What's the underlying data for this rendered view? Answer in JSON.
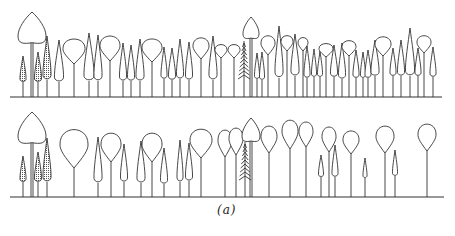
{
  "caption": "(a)",
  "colors": {
    "ink": "#333333",
    "background": "#ffffff"
  },
  "rows": [
    {
      "name": "top-row",
      "ground_y": 97,
      "ground_x": [
        10,
        442
      ],
      "trees": [
        {
          "type": "spade",
          "x": 32,
          "top": 12,
          "w": 28,
          "h": 32
        },
        {
          "type": "shaded",
          "x": 23,
          "top": 56,
          "w": 6,
          "h": 26
        },
        {
          "type": "shaded",
          "x": 38,
          "top": 52,
          "w": 7,
          "h": 30
        },
        {
          "type": "shaded",
          "x": 47,
          "top": 36,
          "w": 8,
          "h": 44
        },
        {
          "type": "narrow",
          "x": 59,
          "top": 40,
          "w": 9,
          "h": 42
        },
        {
          "type": "round",
          "x": 74,
          "top": 38,
          "w": 22,
          "h": 26
        },
        {
          "type": "narrow",
          "x": 89,
          "top": 33,
          "w": 10,
          "h": 48
        },
        {
          "type": "narrow",
          "x": 98,
          "top": 35,
          "w": 8,
          "h": 46
        },
        {
          "type": "round",
          "x": 110,
          "top": 35,
          "w": 20,
          "h": 26
        },
        {
          "type": "narrow",
          "x": 123,
          "top": 43,
          "w": 7,
          "h": 38
        },
        {
          "type": "narrow",
          "x": 131,
          "top": 45,
          "w": 7,
          "h": 36
        },
        {
          "type": "narrow",
          "x": 140,
          "top": 39,
          "w": 8,
          "h": 42
        },
        {
          "type": "round",
          "x": 152,
          "top": 38,
          "w": 20,
          "h": 24
        },
        {
          "type": "narrow",
          "x": 164,
          "top": 47,
          "w": 6,
          "h": 32
        },
        {
          "type": "narrow",
          "x": 172,
          "top": 48,
          "w": 7,
          "h": 32
        },
        {
          "type": "narrow",
          "x": 180,
          "top": 39,
          "w": 7,
          "h": 40
        },
        {
          "type": "narrow",
          "x": 189,
          "top": 42,
          "w": 7,
          "h": 38
        },
        {
          "type": "round",
          "x": 201,
          "top": 37,
          "w": 16,
          "h": 22
        },
        {
          "type": "narrow",
          "x": 213,
          "top": 36,
          "w": 8,
          "h": 44
        },
        {
          "type": "round",
          "x": 221,
          "top": 44,
          "w": 12,
          "h": 14
        },
        {
          "type": "round",
          "x": 234,
          "top": 44,
          "w": 12,
          "h": 14
        },
        {
          "type": "conifer",
          "x": 244,
          "top": 43,
          "w": 10,
          "h": 38
        },
        {
          "type": "spade",
          "x": 251,
          "top": 17,
          "w": 16,
          "h": 22
        },
        {
          "type": "narrow",
          "x": 257,
          "top": 53,
          "w": 5,
          "h": 26
        },
        {
          "type": "narrow",
          "x": 262,
          "top": 52,
          "w": 5,
          "h": 28
        },
        {
          "type": "round",
          "x": 268,
          "top": 35,
          "w": 14,
          "h": 20
        },
        {
          "type": "narrow",
          "x": 279,
          "top": 26,
          "w": 8,
          "h": 52
        },
        {
          "type": "round",
          "x": 287,
          "top": 35,
          "w": 12,
          "h": 16
        },
        {
          "type": "narrow",
          "x": 295,
          "top": 34,
          "w": 8,
          "h": 42
        },
        {
          "type": "round",
          "x": 303,
          "top": 37,
          "w": 10,
          "h": 14
        },
        {
          "type": "narrow",
          "x": 307,
          "top": 46,
          "w": 6,
          "h": 32
        },
        {
          "type": "narrow",
          "x": 314,
          "top": 49,
          "w": 5,
          "h": 28
        },
        {
          "type": "narrow",
          "x": 320,
          "top": 51,
          "w": 5,
          "h": 26
        },
        {
          "type": "round",
          "x": 326,
          "top": 43,
          "w": 14,
          "h": 14
        },
        {
          "type": "narrow",
          "x": 334,
          "top": 45,
          "w": 7,
          "h": 32
        },
        {
          "type": "narrow",
          "x": 342,
          "top": 43,
          "w": 7,
          "h": 36
        },
        {
          "type": "round",
          "x": 349,
          "top": 40,
          "w": 14,
          "h": 16
        },
        {
          "type": "narrow",
          "x": 356,
          "top": 50,
          "w": 6,
          "h": 28
        },
        {
          "type": "narrow",
          "x": 363,
          "top": 52,
          "w": 5,
          "h": 26
        },
        {
          "type": "narrow",
          "x": 368,
          "top": 50,
          "w": 6,
          "h": 28
        },
        {
          "type": "narrow",
          "x": 375,
          "top": 40,
          "w": 8,
          "h": 36
        },
        {
          "type": "round",
          "x": 383,
          "top": 36,
          "w": 16,
          "h": 20
        },
        {
          "type": "narrow",
          "x": 393,
          "top": 48,
          "w": 6,
          "h": 28
        },
        {
          "type": "narrow",
          "x": 401,
          "top": 40,
          "w": 7,
          "h": 36
        },
        {
          "type": "narrow",
          "x": 410,
          "top": 28,
          "w": 9,
          "h": 48
        },
        {
          "type": "narrow",
          "x": 418,
          "top": 48,
          "w": 6,
          "h": 28
        },
        {
          "type": "round",
          "x": 424,
          "top": 35,
          "w": 14,
          "h": 18
        },
        {
          "type": "narrow",
          "x": 433,
          "top": 47,
          "w": 6,
          "h": 30
        }
      ]
    },
    {
      "name": "bottom-row",
      "ground_y": 197,
      "ground_x": [
        10,
        444
      ],
      "trees": [
        {
          "type": "spade",
          "x": 32,
          "top": 112,
          "w": 28,
          "h": 32
        },
        {
          "type": "shaded",
          "x": 23,
          "top": 156,
          "w": 6,
          "h": 26
        },
        {
          "type": "shaded",
          "x": 38,
          "top": 152,
          "w": 7,
          "h": 30
        },
        {
          "type": "shaded",
          "x": 47,
          "top": 138,
          "w": 8,
          "h": 44
        },
        {
          "type": "round",
          "x": 74,
          "top": 128,
          "w": 28,
          "h": 40
        },
        {
          "type": "narrow",
          "x": 98,
          "top": 137,
          "w": 8,
          "h": 46
        },
        {
          "type": "round",
          "x": 111,
          "top": 132,
          "w": 20,
          "h": 30
        },
        {
          "type": "narrow",
          "x": 124,
          "top": 144,
          "w": 7,
          "h": 38
        },
        {
          "type": "narrow",
          "x": 141,
          "top": 141,
          "w": 8,
          "h": 42
        },
        {
          "type": "round",
          "x": 152,
          "top": 132,
          "w": 20,
          "h": 30
        },
        {
          "type": "narrow",
          "x": 164,
          "top": 148,
          "w": 7,
          "h": 36
        },
        {
          "type": "narrow",
          "x": 180,
          "top": 140,
          "w": 6,
          "h": 42
        },
        {
          "type": "narrow",
          "x": 189,
          "top": 143,
          "w": 7,
          "h": 38
        },
        {
          "type": "round",
          "x": 201,
          "top": 128,
          "w": 22,
          "h": 30
        },
        {
          "type": "round",
          "x": 225,
          "top": 129,
          "w": 14,
          "h": 28
        },
        {
          "type": "round",
          "x": 236,
          "top": 127,
          "w": 14,
          "h": 28
        },
        {
          "type": "conifer",
          "x": 245,
          "top": 144,
          "w": 10,
          "h": 36
        },
        {
          "type": "spade",
          "x": 251,
          "top": 118,
          "w": 18,
          "h": 24
        },
        {
          "type": "round",
          "x": 269,
          "top": 125,
          "w": 16,
          "h": 28
        },
        {
          "type": "round",
          "x": 290,
          "top": 119,
          "w": 16,
          "h": 30
        },
        {
          "type": "round",
          "x": 306,
          "top": 121,
          "w": 14,
          "h": 26
        },
        {
          "type": "narrow",
          "x": 321,
          "top": 155,
          "w": 5,
          "h": 22
        },
        {
          "type": "round",
          "x": 329,
          "top": 126,
          "w": 14,
          "h": 26
        },
        {
          "type": "narrow",
          "x": 335,
          "top": 145,
          "w": 6,
          "h": 32
        },
        {
          "type": "round",
          "x": 351,
          "top": 130,
          "w": 16,
          "h": 24
        },
        {
          "type": "narrow",
          "x": 365,
          "top": 158,
          "w": 4,
          "h": 20
        },
        {
          "type": "round",
          "x": 385,
          "top": 125,
          "w": 18,
          "h": 28
        },
        {
          "type": "narrow",
          "x": 395,
          "top": 150,
          "w": 5,
          "h": 26
        },
        {
          "type": "round",
          "x": 427,
          "top": 123,
          "w": 18,
          "h": 28
        }
      ]
    }
  ]
}
